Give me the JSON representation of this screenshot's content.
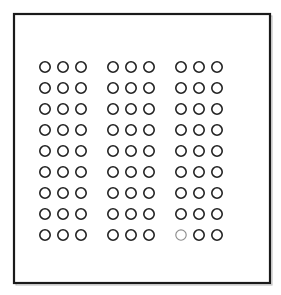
{
  "figure": {
    "title": "Grid array package outline drawing",
    "kind": "line-drawing",
    "canvas": {
      "width": 281,
      "height": 295
    },
    "background_color": "#ffffff"
  },
  "frame": {
    "label": "package-outline",
    "shape": "rectangle",
    "x": 14,
    "y": 14,
    "width": 256,
    "height": 269,
    "stroke_color": "#1a1a1a",
    "stroke_width": 2.2,
    "fill_color": "#ffffff",
    "shadow_offset": 2,
    "shadow_color": "#bdbdbd"
  },
  "grid": {
    "label": "pad-grid",
    "rows": 9,
    "columns": 9,
    "column_groups": 3,
    "columns_per_group": 3,
    "row_groups": 1,
    "total_pads": 81,
    "first_center_x": 45,
    "first_center_y": 67,
    "column_pitch": 18,
    "group_gap": 14,
    "row_pitch": 21,
    "pad_radius": 5.2,
    "pad_stroke_color": "#222222",
    "pad_stroke_width": 1.6,
    "pad_fill_color": "#ffffff",
    "faint_pad_stroke_color": "#8d8d8d",
    "faint_pad_stroke_width": 1.15,
    "faint_pads": [
      {
        "row": 9,
        "column": 7
      }
    ]
  },
  "chart_data": {
    "type": "scatter",
    "subtitle": "",
    "xlabel": "",
    "ylabel": "",
    "xlim": [
      1,
      9
    ],
    "ylim": [
      1,
      9
    ],
    "grid": false,
    "legend": "none",
    "annotations": [],
    "categories_x": [
      "C1",
      "C2",
      "C3",
      "C4",
      "C5",
      "C6",
      "C7",
      "C8",
      "C9"
    ],
    "categories_y": [
      "R1",
      "R2",
      "R3",
      "R4",
      "R5",
      "R6",
      "R7",
      "R8",
      "R9"
    ],
    "series": [
      {
        "name": "pads",
        "marker": "open-circle",
        "count": 81,
        "x": [
          1,
          2,
          3,
          4,
          5,
          6,
          7,
          8,
          9,
          1,
          2,
          3,
          4,
          5,
          6,
          7,
          8,
          9,
          1,
          2,
          3,
          4,
          5,
          6,
          7,
          8,
          9,
          1,
          2,
          3,
          4,
          5,
          6,
          7,
          8,
          9,
          1,
          2,
          3,
          4,
          5,
          6,
          7,
          8,
          9,
          1,
          2,
          3,
          4,
          5,
          6,
          7,
          8,
          9,
          1,
          2,
          3,
          4,
          5,
          6,
          7,
          8,
          9,
          1,
          2,
          3,
          4,
          5,
          6,
          7,
          8,
          9,
          1,
          2,
          3,
          4,
          5,
          6,
          7,
          8,
          9
        ],
        "y": [
          1,
          1,
          1,
          1,
          1,
          1,
          1,
          1,
          1,
          2,
          2,
          2,
          2,
          2,
          2,
          2,
          2,
          2,
          3,
          3,
          3,
          3,
          3,
          3,
          3,
          3,
          3,
          4,
          4,
          4,
          4,
          4,
          4,
          4,
          4,
          4,
          5,
          5,
          5,
          5,
          5,
          5,
          5,
          5,
          5,
          6,
          6,
          6,
          6,
          6,
          6,
          6,
          6,
          6,
          7,
          7,
          7,
          7,
          7,
          7,
          7,
          7,
          7,
          8,
          8,
          8,
          8,
          8,
          8,
          8,
          8,
          8,
          9,
          9,
          9,
          9,
          9,
          9,
          9,
          9,
          9
        ]
      }
    ]
  }
}
